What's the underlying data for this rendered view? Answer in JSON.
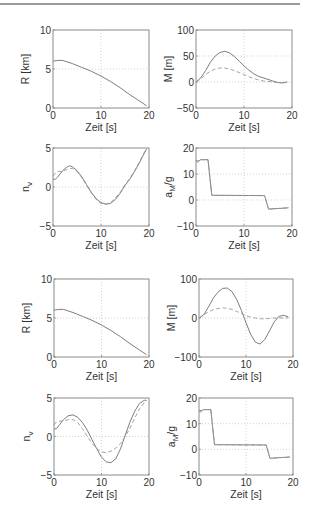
{
  "figure": {
    "xlabel": "Zeit [s]"
  },
  "chart_data": [
    {
      "id": "R1",
      "type": "line",
      "ylabel": "R [km]",
      "xlabel": "Zeit [s]",
      "xlim": [
        0,
        20
      ],
      "ylim": [
        0,
        10
      ],
      "xticks": [
        0,
        10,
        20
      ],
      "yticks": [
        0,
        5,
        10
      ],
      "grid": true,
      "series": [
        {
          "name": "solid",
          "style": "solid",
          "x": [
            0,
            1,
            2,
            4,
            6,
            8,
            10,
            12,
            14,
            16,
            18,
            19.5
          ],
          "y": [
            6.0,
            6.1,
            6.1,
            5.7,
            5.2,
            4.7,
            4.1,
            3.4,
            2.6,
            1.7,
            0.9,
            0.3
          ]
        }
      ]
    },
    {
      "id": "M1",
      "type": "line",
      "ylabel": "M [m]",
      "xlabel": "Zeit [s]",
      "xlim": [
        0,
        20
      ],
      "ylim": [
        -50,
        100
      ],
      "xticks": [
        0,
        10,
        20
      ],
      "yticks": [
        -50,
        0,
        50,
        100
      ],
      "grid": true,
      "series": [
        {
          "name": "solid",
          "style": "solid",
          "x": [
            0,
            1,
            2,
            3,
            4,
            5,
            6,
            7,
            8,
            9,
            10,
            11,
            12,
            13,
            14,
            15,
            16,
            17,
            18,
            19
          ],
          "y": [
            0,
            8,
            22,
            38,
            50,
            57,
            59,
            56,
            49,
            40,
            31,
            23,
            16,
            11,
            8,
            5,
            2,
            -1,
            -2,
            0
          ]
        },
        {
          "name": "dashed",
          "style": "dashed",
          "x": [
            0,
            1,
            2,
            3,
            4,
            5,
            6,
            7,
            8,
            9,
            10,
            11,
            12,
            13,
            14,
            15,
            16,
            17,
            18,
            19
          ],
          "y": [
            0,
            6,
            14,
            21,
            25,
            27,
            27,
            25,
            22,
            18,
            14,
            10,
            7,
            4,
            2,
            1,
            0,
            -1,
            -1,
            0
          ]
        }
      ]
    },
    {
      "id": "nv1",
      "type": "line",
      "ylabel": "n_v",
      "xlabel": "Zeit [s]",
      "xlim": [
        0,
        20
      ],
      "ylim": [
        -5,
        5
      ],
      "xticks": [
        0,
        10,
        20
      ],
      "yticks": [
        -5,
        0,
        5
      ],
      "grid": true,
      "series": [
        {
          "name": "solid",
          "style": "solid",
          "x": [
            0,
            0.5,
            1,
            2,
            3,
            3.5,
            4,
            5,
            6,
            7,
            8,
            9,
            10,
            11,
            12,
            13,
            14,
            15,
            16,
            17,
            18,
            19,
            19.5
          ],
          "y": [
            1.0,
            1.0,
            1.3,
            2.1,
            2.6,
            2.7,
            2.6,
            2.1,
            1.3,
            0.3,
            -0.7,
            -1.5,
            -2.0,
            -2.2,
            -2.1,
            -1.6,
            -0.8,
            0.2,
            1.0,
            2.0,
            3.1,
            4.3,
            4.9
          ]
        },
        {
          "name": "dashed",
          "style": "dashed",
          "x": [
            0,
            0.5,
            1,
            2,
            3,
            4,
            5,
            6,
            7,
            8,
            9,
            10,
            11,
            12,
            13,
            14,
            15,
            16,
            17,
            18,
            19,
            19.5
          ],
          "y": [
            1.4,
            1.8,
            2.0,
            2.0,
            2.3,
            2.4,
            2.0,
            1.2,
            0.2,
            -0.8,
            -1.6,
            -2.1,
            -2.2,
            -2.0,
            -1.4,
            -0.7,
            0.3,
            1.1,
            2.1,
            3.2,
            4.4,
            4.9
          ]
        }
      ]
    },
    {
      "id": "aM1",
      "type": "line",
      "ylabel": "a_M/g",
      "xlabel": "Zeit [s]",
      "xlim": [
        0,
        20
      ],
      "ylim": [
        -10,
        20
      ],
      "xticks": [
        0,
        10,
        20
      ],
      "yticks": [
        -10,
        0,
        10,
        20
      ],
      "grid": true,
      "series": [
        {
          "name": "solid",
          "style": "solid",
          "x": [
            0,
            0.5,
            1,
            2.5,
            3.3,
            14.3,
            15.1,
            19.3
          ],
          "y": [
            15.2,
            15.0,
            15.5,
            15.5,
            1.8,
            1.7,
            -3.5,
            -3.0
          ]
        },
        {
          "name": "dashed",
          "style": "dashed",
          "x": [
            0,
            0.5,
            1,
            2.5,
            3.3,
            14.3,
            15.1,
            19.3
          ],
          "y": [
            14.6,
            14.6,
            15.5,
            15.5,
            1.8,
            1.7,
            -3.5,
            -3.0
          ]
        }
      ]
    },
    {
      "id": "R2",
      "type": "line",
      "ylabel": "R [km]",
      "xlabel": "Zeit [s]",
      "xlim": [
        0,
        20
      ],
      "ylim": [
        0,
        10
      ],
      "xticks": [
        0,
        10,
        20
      ],
      "yticks": [
        0,
        5,
        10
      ],
      "grid": true,
      "series": [
        {
          "name": "solid",
          "style": "solid",
          "x": [
            0,
            1,
            2,
            4,
            6,
            8,
            10,
            12,
            14,
            16,
            18,
            19.5
          ],
          "y": [
            6.0,
            6.1,
            6.1,
            5.7,
            5.2,
            4.7,
            4.1,
            3.4,
            2.6,
            1.7,
            0.9,
            0.3
          ]
        }
      ]
    },
    {
      "id": "M2",
      "type": "line",
      "ylabel": "M [m]",
      "xlabel": "Zeit [s]",
      "xlim": [
        0,
        20
      ],
      "ylim": [
        -100,
        100
      ],
      "xticks": [
        0,
        10,
        20
      ],
      "yticks": [
        -100,
        0,
        100
      ],
      "grid": true,
      "series": [
        {
          "name": "solid",
          "style": "solid",
          "x": [
            0,
            1,
            2,
            3,
            4,
            5,
            6,
            7,
            8,
            9,
            10,
            11,
            12,
            13,
            14,
            15,
            16,
            17,
            18,
            19
          ],
          "y": [
            0,
            8,
            28,
            50,
            66,
            76,
            77,
            68,
            48,
            20,
            -12,
            -42,
            -62,
            -67,
            -55,
            -33,
            -10,
            4,
            7,
            3
          ]
        },
        {
          "name": "dashed",
          "style": "dashed",
          "x": [
            0,
            1,
            2,
            3,
            4,
            5,
            6,
            7,
            8,
            9,
            10,
            11,
            12,
            13,
            14,
            15,
            16,
            17,
            18,
            19
          ],
          "y": [
            0,
            8,
            16,
            21,
            24,
            26,
            25,
            22,
            17,
            12,
            6,
            2,
            0,
            -2,
            -2,
            -1,
            0,
            0,
            0,
            0
          ]
        }
      ]
    },
    {
      "id": "nv2",
      "type": "line",
      "ylabel": "n_v",
      "xlabel": "Zeit [s]",
      "xlim": [
        0,
        20
      ],
      "ylim": [
        -5,
        5
      ],
      "xticks": [
        0,
        10,
        20
      ],
      "yticks": [
        -5,
        0,
        5
      ],
      "grid": true,
      "series": [
        {
          "name": "solid",
          "style": "solid",
          "x": [
            0,
            0.5,
            1,
            2,
            3,
            4,
            5,
            6,
            7,
            8,
            9,
            10,
            11,
            12,
            13,
            14,
            15,
            16,
            17,
            18,
            19,
            19.5
          ],
          "y": [
            1.0,
            1.0,
            1.4,
            2.2,
            2.7,
            2.8,
            2.5,
            1.8,
            0.8,
            -0.4,
            -1.6,
            -2.7,
            -3.3,
            -3.4,
            -2.9,
            -1.6,
            0.2,
            1.9,
            3.3,
            4.3,
            4.7,
            4.7
          ]
        },
        {
          "name": "dashed",
          "style": "dashed",
          "x": [
            0,
            0.5,
            1,
            2,
            3,
            4,
            5,
            6,
            7,
            8,
            9,
            10,
            11,
            12,
            13,
            14,
            15,
            16,
            17,
            18,
            19,
            19.5
          ],
          "y": [
            1.5,
            1.9,
            2.0,
            2.0,
            2.2,
            2.2,
            1.8,
            1.0,
            0.0,
            -0.9,
            -1.6,
            -2.0,
            -2.1,
            -1.9,
            -1.5,
            -0.9,
            0.0,
            1.1,
            2.4,
            3.6,
            4.4,
            4.6
          ]
        }
      ]
    },
    {
      "id": "aM2",
      "type": "line",
      "ylabel": "a_M/g",
      "xlabel": "Zeit [s]",
      "xlim": [
        0,
        20
      ],
      "ylim": [
        -10,
        20
      ],
      "xticks": [
        0,
        10,
        20
      ],
      "yticks": [
        -10,
        0,
        10,
        20
      ],
      "grid": true,
      "series": [
        {
          "name": "solid",
          "style": "solid",
          "x": [
            0,
            0.5,
            1,
            2.5,
            3.3,
            14.3,
            15.1,
            19.3
          ],
          "y": [
            15.2,
            15.0,
            15.5,
            15.5,
            1.8,
            1.7,
            -3.5,
            -3.0
          ]
        },
        {
          "name": "dashed",
          "style": "dashed",
          "x": [
            0,
            0.5,
            1,
            2.5,
            3.3,
            14.3,
            15.1,
            19.3
          ],
          "y": [
            14.6,
            14.6,
            15.5,
            15.5,
            1.8,
            1.7,
            -3.5,
            -3.0
          ]
        }
      ]
    }
  ],
  "layout": {
    "panels": [
      {
        "chart": 0,
        "x": 53,
        "y": 30,
        "w": 96,
        "h": 78
      },
      {
        "chart": 1,
        "x": 196,
        "y": 30,
        "w": 96,
        "h": 78
      },
      {
        "chart": 2,
        "x": 53,
        "y": 148,
        "w": 96,
        "h": 78
      },
      {
        "chart": 3,
        "x": 196,
        "y": 148,
        "w": 96,
        "h": 78
      },
      {
        "chart": 4,
        "x": 54,
        "y": 279,
        "w": 95,
        "h": 78
      },
      {
        "chart": 5,
        "x": 199,
        "y": 279,
        "w": 94,
        "h": 78
      },
      {
        "chart": 6,
        "x": 54,
        "y": 398,
        "w": 95,
        "h": 77
      },
      {
        "chart": 7,
        "x": 199,
        "y": 398,
        "w": 94,
        "h": 77
      }
    ]
  },
  "colors": {
    "axes": "#8a8a8a",
    "grid": "#c8c8c8",
    "line": "#6e6e6e",
    "dashed": "#9a9a9a",
    "text": "#333333"
  }
}
